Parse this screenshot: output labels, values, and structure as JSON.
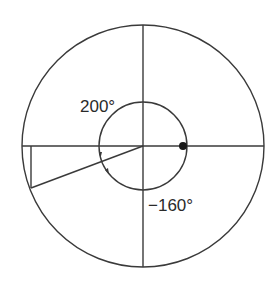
{
  "figure": {
    "labels": {
      "positive_angle": "200°",
      "negative_angle": "−160°"
    },
    "angles_deg": {
      "positive": 200,
      "negative": -160
    },
    "colors": {
      "stroke": "#3a3a3a",
      "background": "#ffffff"
    }
  }
}
